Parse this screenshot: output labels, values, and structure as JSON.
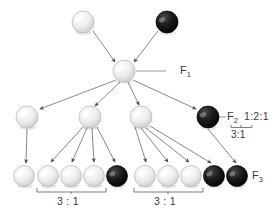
{
  "figure": {
    "type": "genetics-inheritance-diagram",
    "title": "",
    "background_color": "#ffffff",
    "line_color": "#6e6e6e",
    "text_color": "#3a3a3a"
  },
  "generations": [
    {
      "key": "P",
      "label": "",
      "row_y": 22,
      "organisms": [
        {
          "name": "parent-white",
          "phenotype": "white",
          "fill": "#e8e8e8",
          "cx": 83,
          "cy": 22,
          "r": 11
        },
        {
          "name": "parent-black",
          "phenotype": "black",
          "fill": "#161616",
          "cx": 167,
          "cy": 22,
          "r": 11
        }
      ]
    },
    {
      "key": "F1",
      "label": "F",
      "subscript": "1",
      "row_y": 71,
      "organisms": [
        {
          "name": "f1-heterozygote",
          "phenotype": "white",
          "fill": "#ececec",
          "cx": 124,
          "cy": 71,
          "r": 11
        }
      ]
    },
    {
      "key": "F2",
      "label": "F",
      "subscript": "2",
      "row_y": 117,
      "ratio": "1:2:1",
      "sub_ratio": "3:1",
      "organisms": [
        {
          "name": "f2-homozygote-white",
          "phenotype": "white",
          "fill": "#eaeaea",
          "cx": 27,
          "cy": 117,
          "r": 11
        },
        {
          "name": "f2-heterozygote-left",
          "phenotype": "white",
          "fill": "#ececec",
          "cx": 90,
          "cy": 117,
          "r": 11
        },
        {
          "name": "f2-heterozygote-right",
          "phenotype": "white",
          "fill": "#ececec",
          "cx": 141,
          "cy": 117,
          "r": 11
        },
        {
          "name": "f2-homozygote-black",
          "phenotype": "black",
          "fill": "#151515",
          "cx": 208,
          "cy": 117,
          "r": 11
        }
      ]
    },
    {
      "key": "F3",
      "label": "F",
      "subscript": "3",
      "row_y": 176,
      "organisms": [
        {
          "name": "f3-offspring-1",
          "phenotype": "white",
          "fill": "#e9e9e9",
          "cx": 24,
          "cy": 176,
          "r": 10.5
        },
        {
          "name": "f3-offspring-2",
          "phenotype": "white",
          "fill": "#ececec",
          "cx": 48,
          "cy": 176,
          "r": 10.5
        },
        {
          "name": "f3-offspring-3",
          "phenotype": "white",
          "fill": "#ececec",
          "cx": 71,
          "cy": 176,
          "r": 10.5
        },
        {
          "name": "f3-offspring-4",
          "phenotype": "white",
          "fill": "#efefef",
          "cx": 94,
          "cy": 176,
          "r": 10.5
        },
        {
          "name": "f3-offspring-5",
          "phenotype": "black",
          "fill": "#141414",
          "cx": 117,
          "cy": 176,
          "r": 10.5
        },
        {
          "name": "f3-offspring-6",
          "phenotype": "white",
          "fill": "#ececec",
          "cx": 145,
          "cy": 176,
          "r": 10.5
        },
        {
          "name": "f3-offspring-7",
          "phenotype": "white",
          "fill": "#efefef",
          "cx": 168,
          "cy": 176,
          "r": 10.5
        },
        {
          "name": "f3-offspring-8",
          "phenotype": "white",
          "fill": "#ececec",
          "cx": 191,
          "cy": 176,
          "r": 10.5
        },
        {
          "name": "f3-offspring-9",
          "phenotype": "black",
          "fill": "#141414",
          "cx": 214,
          "cy": 176,
          "r": 10.5
        },
        {
          "name": "f3-offspring-10",
          "phenotype": "black",
          "fill": "#141414",
          "cx": 237,
          "cy": 176,
          "r": 10.5
        }
      ]
    }
  ],
  "labels": {
    "f1": "F",
    "f1_sub": "1",
    "f2": "F",
    "f2_sub": "2",
    "f3": "F",
    "f3_sub": "3",
    "f2_ratio": "1:2:1",
    "f2_sub_ratio": "3:1",
    "bracket_left_ratio": "3 : 1",
    "bracket_right_ratio": "3 : 1"
  },
  "brackets": [
    {
      "name": "f3-bracket-left",
      "x1": 37,
      "x2": 106,
      "y": 191,
      "label": "3 : 1",
      "label_x": 71,
      "label_y": 200
    },
    {
      "name": "f3-bracket-right",
      "x1": 134,
      "x2": 203,
      "y": 191,
      "label": "3 : 1",
      "label_x": 168,
      "label_y": 200
    },
    {
      "name": "f2-ratio-brace",
      "x1": 231,
      "x2": 252,
      "y": 127,
      "label": "3:1",
      "label_x": 241,
      "label_y": 134
    }
  ]
}
